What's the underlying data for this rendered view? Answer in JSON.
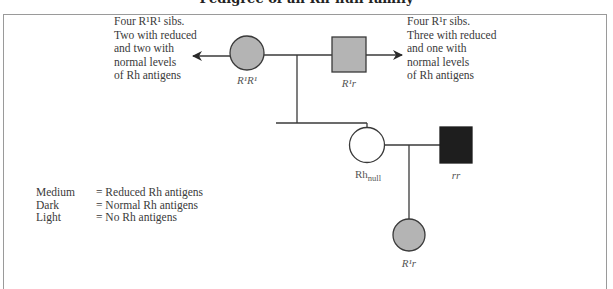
{
  "figure": {
    "title_clipped": "Pedigree of an Rh-null family",
    "colors": {
      "medium": "#b4b4b4",
      "dark": "#1e1e1e",
      "light": "#ffffff",
      "line": "#3a3a3a",
      "frame": "#9a9a9a"
    }
  },
  "annotations": {
    "left_sibs": [
      "Four R¹R¹ sibs.",
      "Two with reduced",
      "and two with",
      "normal levels",
      "of Rh antigens"
    ],
    "right_sibs": [
      "Four R¹r sibs.",
      "Three with reduced",
      "and one with",
      "normal levels",
      "of Rh antigens"
    ]
  },
  "individuals": {
    "grandmother": {
      "label": "R¹R¹",
      "sex": "female",
      "shade": "medium"
    },
    "grandfather": {
      "label": "R¹r",
      "sex": "male",
      "shade": "medium"
    },
    "proband": {
      "label_main": "Rh",
      "label_sub": "null",
      "sex": "female",
      "shade": "light"
    },
    "spouse": {
      "label": "rr",
      "sex": "male",
      "shade": "dark"
    },
    "child": {
      "label": "R¹r",
      "sex": "female",
      "shade": "medium"
    }
  },
  "legend": [
    {
      "key": "Medium",
      "value": "= Reduced Rh antigens"
    },
    {
      "key": "Dark",
      "value": "= Normal Rh antigens"
    },
    {
      "key": "Light",
      "value": "= No Rh antigens"
    }
  ]
}
